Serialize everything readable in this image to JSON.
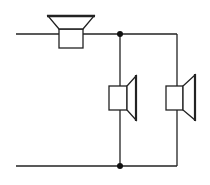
{
  "diagram": {
    "type": "circuit-schematic",
    "colors": {
      "background": "#ffffff",
      "line": "#222222"
    },
    "components": [
      {
        "id": "speaker-series",
        "kind": "loudspeaker",
        "orientation": "up"
      },
      {
        "id": "speaker-parallel-1",
        "kind": "loudspeaker",
        "orientation": "right"
      },
      {
        "id": "speaker-parallel-2",
        "kind": "loudspeaker",
        "orientation": "right"
      }
    ],
    "junctions": 2
  }
}
